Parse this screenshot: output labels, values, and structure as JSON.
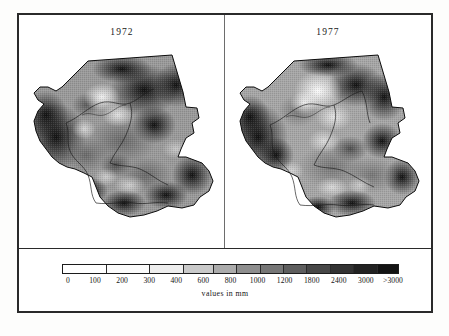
{
  "figure": {
    "type": "map-pair",
    "background_color": "#ffffff",
    "frame_color": "#2a2a2a"
  },
  "panels": [
    {
      "id": "1972",
      "title": "1972",
      "map_name": "rainfall-map-1972"
    },
    {
      "id": "1977",
      "title": "1977",
      "map_name": "rainfall-map-1977"
    }
  ],
  "legend": {
    "caption": "values in mm",
    "tick_labels": [
      "0",
      "100",
      "200",
      "300",
      "400",
      "600",
      "800",
      "1000",
      "1200",
      "1800",
      "2400",
      "3000",
      ">3000"
    ],
    "segment_colors": [
      "#ffffff",
      "#fbfbfb",
      "#ededed",
      "#c9c9c9",
      "#ababab",
      "#8e8e8e",
      "#767676",
      "#5e5e5e",
      "#474747",
      "#333333",
      "#222222",
      "#131313"
    ]
  },
  "chart_data": {
    "type": "heatmap",
    "title": "",
    "subtitle": "",
    "xlabel": "",
    "ylabel": "",
    "legend_position": "bottom",
    "grid": false,
    "colorbar": {
      "label": "values in mm",
      "ticks": [
        0,
        100,
        200,
        300,
        400,
        600,
        800,
        1000,
        1200,
        1800,
        2400,
        3000,
        3000
      ],
      "tick_labels": [
        "0",
        "100",
        "200",
        "300",
        "400",
        "600",
        "800",
        "1000",
        "1200",
        "1800",
        "2400",
        "3000",
        ">3000"
      ],
      "scale": "categorical-bins",
      "low_color": "#ffffff",
      "high_color": "#131313",
      "bins": [
        {
          "range": "0-100",
          "color": "#ffffff"
        },
        {
          "range": "100-200",
          "color": "#fbfbfb"
        },
        {
          "range": "200-300",
          "color": "#ededed"
        },
        {
          "range": "300-400",
          "color": "#c9c9c9"
        },
        {
          "range": "400-600",
          "color": "#ababab"
        },
        {
          "range": "600-800",
          "color": "#8e8e8e"
        },
        {
          "range": "800-1000",
          "color": "#767676"
        },
        {
          "range": "1000-1200",
          "color": "#5e5e5e"
        },
        {
          "range": "1200-1800",
          "color": "#474747"
        },
        {
          "range": "1800-2400",
          "color": "#333333"
        },
        {
          "range": "2400-3000",
          "color": "#222222"
        },
        {
          "range": ">3000",
          "color": "#131313"
        }
      ]
    },
    "panels": [
      {
        "label": "1972",
        "description": "Grayscale raster map of values in mm over a country outline with internal administrative and river boundaries."
      },
      {
        "label": "1977",
        "description": "Grayscale raster map of values in mm over the same country outline with internal administrative and river boundaries."
      }
    ]
  }
}
